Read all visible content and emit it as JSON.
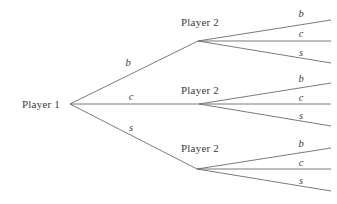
{
  "figure": {
    "kind": "extensive-form-game-tree",
    "background_color": "#ffffff",
    "edge_color": "#6b6b6b",
    "text_color": "#3a3a3a",
    "width": 337,
    "height": 204
  },
  "nodes": {
    "root": {
      "label": "Player 1",
      "x": 41,
      "y": 104,
      "vertex_x": 70,
      "vertex_y": 104
    },
    "second_level": [
      {
        "label": "Player 2",
        "x": 200,
        "y": 22,
        "vertex_x": 198,
        "vertex_y": 41
      },
      {
        "label": "Player 2",
        "x": 200,
        "y": 90,
        "vertex_x": 199,
        "vertex_y": 104
      },
      {
        "label": "Player 2",
        "x": 200,
        "y": 148,
        "vertex_x": 197,
        "vertex_y": 169
      }
    ]
  },
  "first_level_actions": [
    {
      "label": "b",
      "x": 128,
      "y": 62
    },
    {
      "label": "c",
      "x": 131,
      "y": 96
    },
    {
      "label": "s",
      "x": 131,
      "y": 127
    }
  ],
  "second_level_actions": [
    {
      "label": "b",
      "x": 301,
      "y": 13
    },
    {
      "label": "c",
      "x": 301,
      "y": 33
    },
    {
      "label": "s",
      "x": 301,
      "y": 52
    },
    {
      "label": "b",
      "x": 301,
      "y": 78
    },
    {
      "label": "c",
      "x": 301,
      "y": 97
    },
    {
      "label": "s",
      "x": 301,
      "y": 115
    },
    {
      "label": "b",
      "x": 301,
      "y": 143
    },
    {
      "label": "c",
      "x": 301,
      "y": 162
    },
    {
      "label": "s",
      "x": 301,
      "y": 180
    }
  ],
  "edges": {
    "first_level": [
      {
        "from": "root",
        "to": "player2-top",
        "x1": 70,
        "y1": 104,
        "x2": 198,
        "y2": 41
      },
      {
        "from": "root",
        "to": "player2-middle",
        "x1": 70,
        "y1": 104,
        "x2": 199,
        "y2": 104
      },
      {
        "from": "root",
        "to": "player2-bottom",
        "x1": 70,
        "y1": 104,
        "x2": 197,
        "y2": 169
      }
    ],
    "second_level": [
      {
        "group": "top",
        "action": "b",
        "x1": 198,
        "y1": 41,
        "x2": 331,
        "y2": 20
      },
      {
        "group": "top",
        "action": "c",
        "x1": 198,
        "y1": 41,
        "x2": 331,
        "y2": 41
      },
      {
        "group": "top",
        "action": "s",
        "x1": 198,
        "y1": 41,
        "x2": 331,
        "y2": 63
      },
      {
        "group": "middle",
        "action": "b",
        "x1": 199,
        "y1": 104,
        "x2": 331,
        "y2": 83
      },
      {
        "group": "middle",
        "action": "c",
        "x1": 199,
        "y1": 104,
        "x2": 331,
        "y2": 104
      },
      {
        "group": "middle",
        "action": "s",
        "x1": 199,
        "y1": 104,
        "x2": 331,
        "y2": 126
      },
      {
        "group": "bottom",
        "action": "b",
        "x1": 197,
        "y1": 169,
        "x2": 331,
        "y2": 148
      },
      {
        "group": "bottom",
        "action": "c",
        "x1": 197,
        "y1": 169,
        "x2": 331,
        "y2": 169
      },
      {
        "group": "bottom",
        "action": "s",
        "x1": 197,
        "y1": 169,
        "x2": 331,
        "y2": 191
      }
    ]
  }
}
